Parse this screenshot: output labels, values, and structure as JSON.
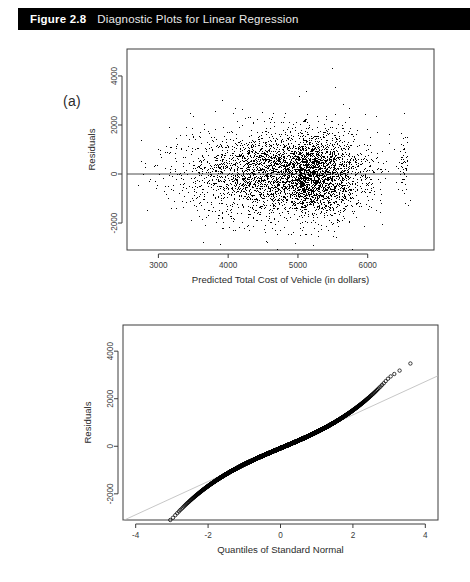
{
  "header": {
    "figure_number": "Figure 2.8",
    "title": "Diagnostic Plots for Linear Regression",
    "bar_color": "#000000",
    "text_color": "#ffffff"
  },
  "panels": [
    {
      "id": "a",
      "label": "(a)"
    },
    {
      "id": "b",
      "label": "(b)"
    }
  ],
  "chart_data": [
    {
      "type": "scatter",
      "panel": "(a)",
      "title": "",
      "xlabel": "Predicted Total Cost of Vehicle (in dollars)",
      "ylabel": "Residuals",
      "xlim": [
        2550,
        6950
      ],
      "ylim": [
        -3100,
        5100
      ],
      "xticks": [
        3000,
        4000,
        5000,
        6000
      ],
      "xtick_labels": [
        "3000",
        "4000",
        "5000",
        "6000"
      ],
      "yticks": [
        -2000,
        0,
        2000,
        4000
      ],
      "ytick_labels": [
        "-2000",
        "0",
        "2000",
        "4000"
      ],
      "grid": false,
      "legend": "none",
      "marker": "filled-point",
      "marker_color": "#000000",
      "n_points": 9000,
      "reference_line": {
        "type": "horizontal",
        "y": 0,
        "color": "#4d4d4d"
      },
      "description": "Residuals versus predicted values; dense elliptical cloud centered near x=5000, y=0, with a vertical streak of points near x=6500 and scattered outliers up to about 4500 and down to about -2800.",
      "cloud": {
        "x_center": 5000,
        "y_center": 0,
        "x_spread": 620,
        "y_spread": 760,
        "x_skew": -0.35
      },
      "extra_cluster": {
        "x_center": 6520,
        "y_center": 350,
        "x_spread": 40,
        "y_spread": 700,
        "n_points": 120
      }
    },
    {
      "type": "scatter",
      "panel": "(b)",
      "title": "",
      "xlabel": "Quantiles of Standard Normal",
      "ylabel": "Residuals",
      "xlim": [
        -4.35,
        4.35
      ],
      "ylim": [
        -3100,
        5100
      ],
      "xticks": [
        -4,
        -2,
        0,
        2,
        4
      ],
      "xtick_labels": [
        "-4",
        "-2",
        "0",
        "2",
        "4"
      ],
      "yticks": [
        -2000,
        0,
        2000,
        4000
      ],
      "ytick_labels": [
        "-2000",
        "0",
        "2000",
        "4000"
      ],
      "grid": false,
      "legend": "none",
      "marker": "open-circle",
      "marker_color": "#000000",
      "n_points": 9000,
      "reference_line": {
        "type": "qq-line",
        "slope": 700,
        "intercept": -80,
        "color": "#b9b9b9"
      },
      "description": "Normal quantile-quantile plot of residuals; points form an S-shaped curve lying above the reference line at both tails, indicating heavy tails, with isolated open circles near -3.9 and +3.8.",
      "curve_shape": {
        "tail_inflation": 1.55,
        "center_slope": 640
      }
    }
  ]
}
